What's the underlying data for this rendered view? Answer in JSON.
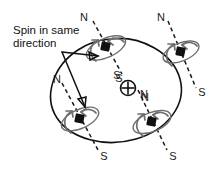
{
  "figure": {
    "title": "Spin in same direction",
    "caption": {
      "line1": "Spin in same",
      "line2": "direction"
    },
    "colors": {
      "ink": "#111111",
      "dash": "#1a1a1a",
      "spin_gray": "#6e6e6e",
      "background": "#ffffff"
    },
    "center_magnet": {
      "symbol": "⊕",
      "north_label": "N",
      "south_label": "S"
    },
    "magnets": [
      {
        "id": "top-left",
        "north_label": "N",
        "south_label": "S",
        "spin": "same"
      },
      {
        "id": "top-right",
        "north_label": "N",
        "south_label": "S",
        "spin": "same"
      },
      {
        "id": "bottom-left",
        "north_label": "N",
        "south_label": "S",
        "spin": "same"
      },
      {
        "id": "bottom-right",
        "north_label": "N",
        "south_label": "S",
        "spin": "same"
      }
    ]
  }
}
